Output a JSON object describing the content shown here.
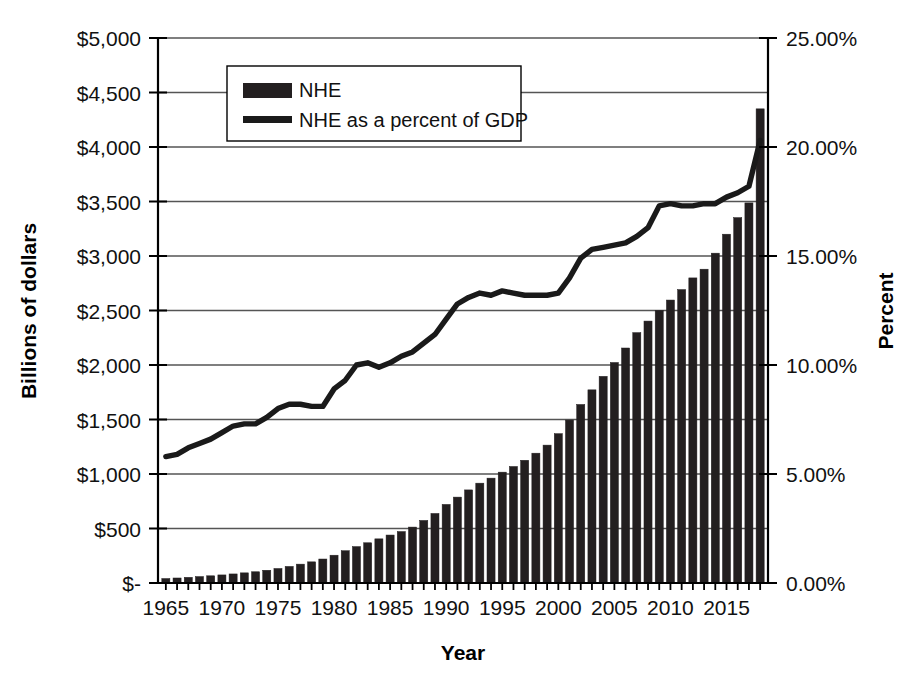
{
  "chart_data": {
    "type": "bar",
    "title": "",
    "xlabel": "Year",
    "ylabel": "Billions of dollars",
    "y2label": "Percent",
    "xlim": [
      1964.3,
      2018.7
    ],
    "ylim": [
      0,
      5000
    ],
    "y2lim": [
      0,
      25
    ],
    "grid": true,
    "legend_position": "top-center-inside",
    "x_tick_labels": [
      "1965",
      "1970",
      "1975",
      "1980",
      "1985",
      "1990",
      "1995",
      "2000",
      "2005",
      "2010",
      "2015"
    ],
    "x_tick_values": [
      1965,
      1970,
      1975,
      1980,
      1985,
      1990,
      1995,
      2000,
      2005,
      2010,
      2015
    ],
    "y_tick_labels": [
      "$-",
      "$500",
      "$1,000",
      "$1,500",
      "$2,000",
      "$2,500",
      "$3,000",
      "$3,500",
      "$4,000",
      "$4,500",
      "$5,000"
    ],
    "y_tick_values": [
      0,
      500,
      1000,
      1500,
      2000,
      2500,
      3000,
      3500,
      4000,
      4500,
      5000
    ],
    "y2_tick_labels": [
      "0.00%",
      "5.00%",
      "10.00%",
      "15.00%",
      "20.00%",
      "25.00%"
    ],
    "y2_tick_values": [
      0,
      5,
      10,
      15,
      20,
      25
    ],
    "categories": [
      1965,
      1966,
      1967,
      1968,
      1969,
      1970,
      1971,
      1972,
      1973,
      1974,
      1975,
      1976,
      1977,
      1978,
      1979,
      1980,
      1981,
      1982,
      1983,
      1984,
      1985,
      1986,
      1987,
      1988,
      1989,
      1990,
      1991,
      1992,
      1993,
      1994,
      1995,
      1996,
      1997,
      1998,
      1999,
      2000,
      2001,
      2002,
      2003,
      2004,
      2005,
      2006,
      2007,
      2008,
      2009,
      2010,
      2011,
      2012,
      2013,
      2014,
      2015,
      2016,
      2017,
      2018
    ],
    "series": [
      {
        "name": "NHE",
        "type": "bar",
        "axis": "left",
        "unit": "billions of dollars",
        "color": "#231f20",
        "values": [
          41,
          46,
          52,
          59,
          66,
          74,
          83,
          93,
          103,
          117,
          133,
          152,
          173,
          194,
          220,
          255,
          296,
          334,
          369,
          405,
          440,
          472,
          513,
          574,
          638,
          721,
          788,
          854,
          916,
          962,
          1017,
          1069,
          1126,
          1191,
          1265,
          1370,
          1495,
          1638,
          1772,
          1896,
          2023,
          2156,
          2297,
          2403,
          2501,
          2596,
          2692,
          2799,
          2879,
          3026,
          3200,
          3352,
          3487,
          4350
        ]
      },
      {
        "name": "NHE as a percent of GDP",
        "type": "line",
        "axis": "right",
        "unit": "percent of GDP",
        "color": "#1a1a1a",
        "values": [
          5.8,
          5.9,
          6.2,
          6.4,
          6.6,
          6.9,
          7.2,
          7.3,
          7.3,
          7.6,
          8.0,
          8.2,
          8.2,
          8.1,
          8.1,
          8.9,
          9.3,
          10.0,
          10.1,
          9.9,
          10.1,
          10.4,
          10.6,
          11.0,
          11.4,
          12.1,
          12.8,
          13.1,
          13.3,
          13.2,
          13.4,
          13.3,
          13.2,
          13.2,
          13.2,
          13.3,
          14.0,
          14.9,
          15.3,
          15.4,
          15.5,
          15.6,
          15.9,
          16.3,
          17.3,
          17.4,
          17.3,
          17.3,
          17.4,
          17.4,
          17.7,
          17.9,
          18.2,
          20.3
        ]
      }
    ]
  },
  "legend": {
    "items": [
      {
        "label": "NHE",
        "marker": "bar-swatch",
        "color": "#231f20"
      },
      {
        "label": "NHE as a percent of GDP",
        "marker": "line-swatch",
        "color": "#1a1a1a"
      }
    ]
  },
  "axes": {
    "left_title": "Billions of dollars",
    "right_title": "Percent",
    "bottom_title": "Year"
  },
  "colors": {
    "bar": "#231f20",
    "line": "#1a1a1a",
    "gridline": "#555555",
    "axis": "#000000",
    "background": "#ffffff"
  }
}
